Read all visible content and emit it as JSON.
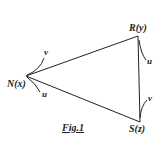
{
  "figure": {
    "caption": "Fig.1",
    "vertices": {
      "N": {
        "label": "N(x)"
      },
      "R": {
        "label": "R(y)"
      },
      "S": {
        "label": "S(z)"
      }
    },
    "edges": [
      {
        "from": "N",
        "to": "R"
      },
      {
        "from": "R",
        "to": "S"
      },
      {
        "from": "S",
        "to": "N"
      }
    ],
    "angle_labels": {
      "N_upper": "v",
      "N_lower": "u",
      "R": "u",
      "S": "v"
    },
    "colors": {
      "ink": "#222222",
      "background": "#ffffff"
    }
  }
}
